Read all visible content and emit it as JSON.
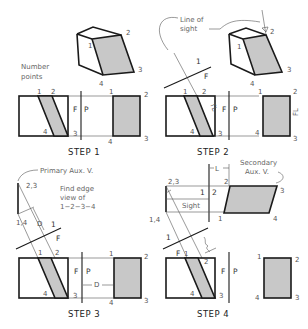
{
  "figure": {
    "colors": {
      "background": "#ffffff",
      "line": "#1a1a1a",
      "thin_line": "#555555",
      "shaded_face": "#c8c8c8",
      "label": "#555555"
    },
    "steps": [
      {
        "title": "STEP 1",
        "note": [
          "Number",
          "points"
        ],
        "iso_labels": {
          "p1": "1",
          "p2": "2",
          "p3": "3",
          "p4": "4"
        },
        "front_labels": {
          "p1": "1",
          "p2": "2",
          "p3": "3",
          "p4": "4"
        },
        "fold": {
          "left": "F",
          "right": "P"
        },
        "profile_labels": {
          "p1": "1",
          "p2": "2",
          "p3": "3",
          "p4": "4"
        }
      },
      {
        "title": "STEP 2",
        "callout": [
          "Line of",
          "sight"
        ],
        "iso_labels": {
          "p1": "1",
          "p2": "2",
          "p3": "3",
          "p4": "4"
        },
        "front_labels": {
          "p1": "1",
          "p2": "2",
          "p3": "3",
          "p4": "4"
        },
        "fold": {
          "left": "F",
          "right": "P"
        },
        "aux_fold": {
          "top": "1",
          "bottom": "F"
        },
        "tl_label": "TL",
        "fl_label": "FL",
        "profile_labels": {
          "p1": "1",
          "p2": "2",
          "p3": "3",
          "p4": "4"
        }
      },
      {
        "title": "STEP 3",
        "callout": "Primary Aux. V.",
        "note": [
          "Find edge",
          "view of",
          "1−2−3−4"
        ],
        "aux_labels": {
          "p23": "2,3",
          "p14": "1,4",
          "d": "D"
        },
        "aux_fold": {
          "top": "1",
          "bottom": "F"
        },
        "front_labels": {
          "p1": "1",
          "p2": "2",
          "p3": "3",
          "p4": "4"
        },
        "fold": {
          "left": "F",
          "right": "P"
        },
        "dimension": "D",
        "profile_labels": {
          "p1": "1",
          "p2": "2",
          "p3": "3",
          "p4": "4"
        }
      },
      {
        "title": "STEP 4",
        "callout": [
          "Secondary",
          "Aux. V."
        ],
        "secondary_labels": {
          "p23": "2,3",
          "p14": "1,4",
          "p1": "1",
          "p2": "2",
          "p3": "3",
          "p4": "4"
        },
        "secondary_fold": {
          "left": "1",
          "right": "2"
        },
        "dimension": "L",
        "sight_label": "Sight",
        "aux_fold": {
          "top": "1",
          "bottom": "F"
        },
        "front_labels": {
          "p1": "1",
          "p2": "2",
          "p3": "3",
          "p4": "4"
        },
        "fold": {
          "left": "F",
          "right": "P"
        },
        "profile_labels": {
          "p1": "1",
          "p2": "2",
          "p3": "3",
          "p4": "4"
        }
      }
    ]
  }
}
